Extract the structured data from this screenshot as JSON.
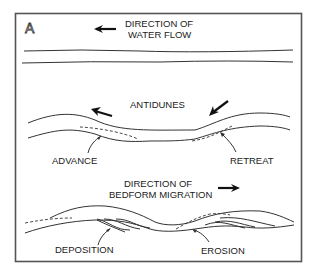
{
  "panel_label": "A",
  "sections": {
    "water_flow": {
      "title_line1": "DIRECTION OF",
      "title_line2": "WATER FLOW",
      "arrow_direction": "left"
    },
    "antidunes": {
      "title": "ANTIDUNES",
      "labels": {
        "advance": "ADVANCE",
        "retreat": "RETREAT"
      }
    },
    "bedform_migration": {
      "title_line1": "DIRECTION OF",
      "title_line2": "BEDFORM MIGRATION",
      "arrow_direction": "right",
      "labels": {
        "deposition": "DEPOSITION",
        "erosion": "EROSION"
      }
    }
  },
  "colors": {
    "stroke": "#333333",
    "frame": "#555555",
    "background": "#ffffff"
  }
}
